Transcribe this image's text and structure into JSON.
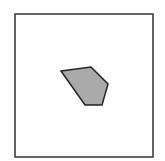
{
  "figure": {
    "background": "#ffffff",
    "frame": {
      "x": 15,
      "y": 14,
      "width": 138,
      "height": 143,
      "stroke": "#333333",
      "stroke_width": 1.5,
      "fill": "#ffffff"
    },
    "polygon": {
      "points": "61,71 91,67 108,84 102,105 85,105",
      "vertices": [
        [
          61,
          71
        ],
        [
          91,
          67
        ],
        [
          108,
          84
        ],
        [
          102,
          105
        ],
        [
          85,
          105
        ]
      ],
      "fill": "#aaaaaa",
      "stroke": "#222222",
      "stroke_width": 1.5
    }
  }
}
